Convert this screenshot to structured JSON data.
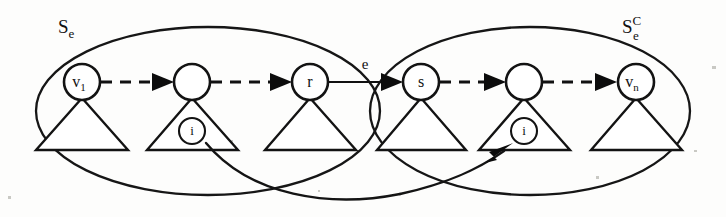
{
  "figure": {
    "background_color": "#fdfdfc",
    "stroke_color": "#131313",
    "width": 726,
    "height": 217
  },
  "sets": [
    {
      "id": "left-set",
      "base": "S",
      "subscript": "e",
      "superscript": "",
      "label_x": 58,
      "label_y": 28,
      "ellipse": {
        "cx": 208,
        "cy": 111,
        "rx": 172,
        "ry": 84
      }
    },
    {
      "id": "right-set",
      "base": "S",
      "subscript": "e",
      "superscript": "C",
      "label_x": 622,
      "label_y": 26,
      "ellipse": {
        "cx": 530,
        "cy": 111,
        "rx": 160,
        "ry": 84
      }
    }
  ],
  "nodes": [
    {
      "id": "n1",
      "base": "v",
      "subscript": "1",
      "cx": 82,
      "cy": 82,
      "r": 18,
      "has_info": false,
      "info_label": ""
    },
    {
      "id": "n2",
      "base": "",
      "subscript": "",
      "cx": 192,
      "cy": 82,
      "r": 18,
      "has_info": true,
      "info_label": "i"
    },
    {
      "id": "n3",
      "base": "r",
      "subscript": "",
      "cx": 310,
      "cy": 82,
      "r": 18,
      "has_info": false,
      "info_label": ""
    },
    {
      "id": "n4",
      "base": "s",
      "subscript": "",
      "cx": 421,
      "cy": 82,
      "r": 18,
      "has_info": false,
      "info_label": ""
    },
    {
      "id": "n5",
      "base": "",
      "subscript": "",
      "cx": 524,
      "cy": 82,
      "r": 18,
      "has_info": true,
      "info_label": "i"
    },
    {
      "id": "n6",
      "base": "v",
      "subscript": "n",
      "cx": 636,
      "cy": 82,
      "r": 18,
      "has_info": false,
      "info_label": ""
    }
  ],
  "edges": [
    {
      "id": "e12",
      "from": "n1",
      "to": "n2",
      "style": "dashed",
      "label": ""
    },
    {
      "id": "e23",
      "from": "n2",
      "to": "n3",
      "style": "dashed",
      "label": ""
    },
    {
      "id": "e34",
      "from": "n3",
      "to": "n4",
      "style": "solid",
      "label": "e",
      "label_x": 365,
      "label_y": 67
    },
    {
      "id": "e45",
      "from": "n4",
      "to": "n5",
      "style": "dashed",
      "label": ""
    },
    {
      "id": "e56",
      "from": "n5",
      "to": "n6",
      "style": "dashed",
      "label": ""
    }
  ],
  "curved_edge": {
    "id": "info-transfer",
    "from": "left-info-circle",
    "to": "right-info-circle",
    "label": "",
    "directed": true
  },
  "annotations": {
    "subtree_shape": "triangle",
    "info_marker_shape": "small-circle-with-i"
  }
}
